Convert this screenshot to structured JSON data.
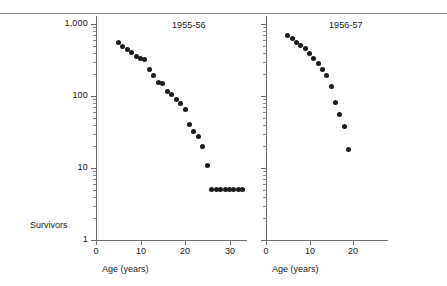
{
  "figure": {
    "y_axis_title": "Survivors",
    "x_axis_title_left": "Age (years)",
    "x_axis_title_right": "Age (years)"
  },
  "chart_data": [
    {
      "type": "scatter",
      "title": "1955-56",
      "xlabel": "Age (years)",
      "ylabel": "Survivors",
      "yscale": "log",
      "ylim": [
        1,
        1000
      ],
      "xlim": [
        0,
        34
      ],
      "ytick_labels": [
        "1,000",
        "100",
        "10",
        "1"
      ],
      "ytick_values": [
        1000,
        100,
        10,
        1
      ],
      "xtick_labels": [
        "0",
        "10",
        "20",
        "30"
      ],
      "xtick_values": [
        0,
        10,
        20,
        30
      ],
      "grid": false,
      "legend": "none",
      "x": [
        5,
        6,
        7,
        8,
        9,
        10,
        11,
        12,
        13,
        14,
        15,
        16,
        17,
        18,
        19,
        20,
        21,
        22,
        23,
        24,
        25,
        26,
        27,
        28,
        29,
        30,
        31,
        32,
        33
      ],
      "y": [
        550,
        490,
        440,
        400,
        350,
        330,
        320,
        230,
        190,
        155,
        148,
        115,
        105,
        90,
        78,
        64,
        40,
        32,
        27,
        20,
        11,
        5,
        5,
        5,
        5,
        5,
        5,
        5,
        5
      ]
    },
    {
      "type": "scatter",
      "title": "1956-57",
      "xlabel": "Age (years)",
      "ylabel": "Survivors",
      "yscale": "log",
      "ylim": [
        1,
        1000
      ],
      "xlim": [
        0,
        28
      ],
      "ytick_labels": [],
      "ytick_values": [
        1000,
        100,
        10,
        1
      ],
      "xtick_labels": [
        "0",
        "10",
        "20"
      ],
      "xtick_values": [
        0,
        10,
        20
      ],
      "grid": false,
      "legend": "none",
      "x": [
        5,
        6,
        7,
        8,
        9,
        10,
        11,
        12,
        13,
        14,
        15,
        16,
        17,
        18,
        19
      ],
      "y": [
        700,
        620,
        560,
        510,
        450,
        390,
        330,
        280,
        235,
        195,
        135,
        80,
        55,
        38,
        18,
        10
      ]
    }
  ]
}
